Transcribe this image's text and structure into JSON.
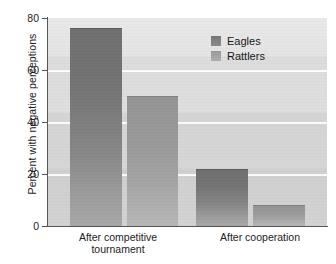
{
  "chart_data": {
    "type": "bar",
    "title": "",
    "xlabel": "",
    "ylabel": "Percent with negative perceptions",
    "categories": [
      "After competitive tournament",
      "After cooperation"
    ],
    "category_lines": [
      [
        "After competitive",
        "tournament"
      ],
      [
        "After cooperation"
      ]
    ],
    "series": [
      {
        "name": "Eagles",
        "values": [
          76,
          22
        ],
        "color": "#757575"
      },
      {
        "name": "Rattlers",
        "values": [
          50,
          8
        ],
        "color": "#9d9d9d"
      }
    ],
    "ylim": [
      0,
      80
    ],
    "yticks": [
      0,
      20,
      40,
      60,
      80
    ],
    "ytick_labels": [
      "0",
      "20",
      "40",
      "60",
      "80"
    ],
    "grid": true,
    "grid_axis": "y",
    "legend_position": "top-right",
    "legend_entries": [
      "Eagles",
      "Rattlers"
    ],
    "panel_background": "#dcdcdc",
    "gridline_color": "#ffffff"
  },
  "axes": {
    "y_title": "Percent with negative perceptions",
    "y_tick_labels": [
      "80",
      "60",
      "40",
      "20",
      "0"
    ]
  },
  "legend": {
    "items": [
      {
        "label": "Eagles"
      },
      {
        "label": "Rattlers"
      }
    ]
  },
  "x_axis": {
    "groups": [
      {
        "line1": "After competitive",
        "line2": "tournament"
      },
      {
        "line1": "After cooperation",
        "line2": ""
      }
    ]
  }
}
